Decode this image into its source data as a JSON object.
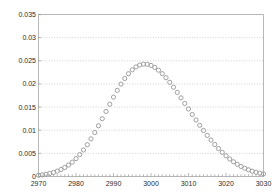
{
  "chart_data": {
    "type": "scatter",
    "title": "",
    "subtitle": "",
    "xlabel": "",
    "ylabel": "",
    "xlim": [
      2970,
      3030
    ],
    "ylim": [
      0,
      0.035
    ],
    "grid": true,
    "grid_orientation": "horizontal",
    "grid_style": "dotted",
    "legend": null,
    "legend_position": "none",
    "marker": "dot",
    "marker_color": "#9b9b9b",
    "marker_size": 2.1,
    "frame_color": "#b0b0b0",
    "text_color": "#2b2b2b",
    "background": "#ffffff",
    "distribution": {
      "shape": "gaussian",
      "mean": 3000,
      "sigma": 11,
      "peak": 0.0305
    },
    "xticks": [
      2970,
      2980,
      2990,
      3000,
      3010,
      3020,
      3030
    ],
    "xtick_labels": [
      "2970",
      "2980",
      "2990",
      "3000",
      "3010",
      "3020",
      "3030"
    ],
    "xminor_tick_step": 1,
    "yticks": [
      0,
      0.005,
      0.01,
      0.015,
      0.02,
      0.025,
      0.03,
      0.035
    ],
    "ytick_labels": [
      "0",
      "0.005",
      "0.01",
      "0.015",
      "0.02",
      "0.025",
      "0.03",
      "0.035"
    ],
    "x": [
      2970,
      2971,
      2972,
      2973,
      2974,
      2975,
      2976,
      2977,
      2978,
      2979,
      2980,
      2981,
      2982,
      2983,
      2984,
      2985,
      2986,
      2987,
      2988,
      2989,
      2990,
      2991,
      2992,
      2993,
      2994,
      2995,
      2996,
      2997,
      2998,
      2999,
      3000,
      3001,
      3002,
      3003,
      3004,
      3005,
      3006,
      3007,
      3008,
      3009,
      3010,
      3011,
      3012,
      3013,
      3014,
      3015,
      3016,
      3017,
      3018,
      3019,
      3020,
      3021,
      3022,
      3023,
      3024,
      3025,
      3026,
      3027,
      3028,
      3029,
      3030
    ],
    "y": [
      0.00026,
      0.00036,
      0.00049,
      0.00066,
      0.00088,
      0.00116,
      0.00151,
      0.00194,
      0.00247,
      0.0031,
      0.00386,
      0.00473,
      0.00574,
      0.00687,
      0.00813,
      0.0095,
      0.01096,
      0.01249,
      0.01405,
      0.01562,
      0.01715,
      0.01861,
      0.01996,
      0.02117,
      0.02221,
      0.02305,
      0.02368,
      0.02408,
      0.02427,
      0.02424,
      0.024,
      0.02357,
      0.02297,
      0.02222,
      0.02134,
      0.02036,
      0.01929,
      0.01816,
      0.01699,
      0.01579,
      0.01459,
      0.01339,
      0.01221,
      0.01106,
      0.00995,
      0.00888,
      0.00787,
      0.00692,
      0.00603,
      0.00521,
      0.00446,
      0.00378,
      0.00318,
      0.00264,
      0.00218,
      0.00178,
      0.00144,
      0.00115,
      0.00092,
      0.00072,
      0.00056
    ]
  },
  "axes": {
    "y_axis_name": "y-axis",
    "x_axis_name": "x-axis"
  }
}
